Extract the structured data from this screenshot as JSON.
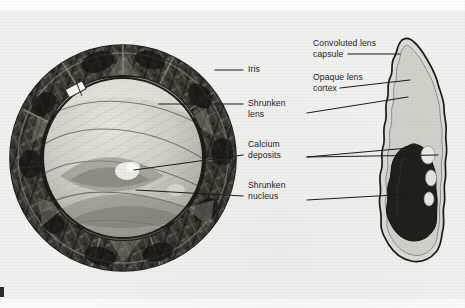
{
  "figure": {
    "title_visible": false,
    "background_color": "#f1f1ef",
    "ink_color": "#1b1b1b",
    "panels": [
      {
        "name": "frontal-eye-view",
        "description": "Circular frontal view of eye showing iris ring and shrunken cataractous lens"
      },
      {
        "name": "lens-cross-section",
        "description": "Vertical sagittal cross-section of hypermature cataractous lens"
      }
    ]
  },
  "labels": {
    "left_column": [
      {
        "id": "iris",
        "lines": [
          "Iris"
        ]
      },
      {
        "id": "shrunken-lens",
        "lines": [
          "Shrunken",
          "lens"
        ]
      },
      {
        "id": "calcium-deposits",
        "lines": [
          "Calcium",
          "deposits"
        ]
      },
      {
        "id": "shrunken-nucleus",
        "lines": [
          "Shrunken",
          "nucleus"
        ]
      }
    ],
    "right_column": [
      {
        "id": "convoluted-lens-capsule",
        "lines": [
          "Convoluted lens",
          "capsule"
        ]
      },
      {
        "id": "opaque-lens-cortex",
        "lines": [
          "Opaque lens",
          "cortex"
        ]
      }
    ]
  },
  "colors": {
    "paper": "#f1f1ef",
    "iris_dark": "#2a2724",
    "iris_mid": "#6d6a63",
    "lens_body": "#cfcdc6",
    "capsule_fill": "#d9d8d2",
    "nucleus_dark": "#201f1d",
    "deposit_light": "#f0eeea",
    "outline": "#1b1b1b"
  }
}
